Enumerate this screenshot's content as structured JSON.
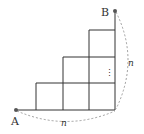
{
  "diagram": {
    "points": [
      {
        "name": "A",
        "label": "A"
      },
      {
        "name": "B",
        "label": "B"
      }
    ],
    "side_labels": {
      "bottom": "n",
      "right": "n"
    },
    "ellipsis": "⋮",
    "colors": {
      "line": "#333333",
      "dot": "#555555",
      "dashed": "#888888"
    }
  }
}
